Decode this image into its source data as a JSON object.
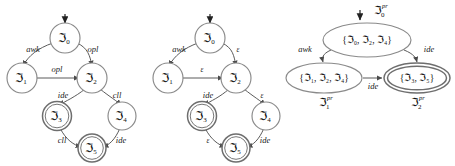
{
  "figure": {
    "name": "finite-automata-construction",
    "background_color": "#ffffff",
    "stroke_color": "#8a8a8a",
    "text_color": "#121212",
    "panels": [
      {
        "id": "nfa-left",
        "name": "nfa-with-symbol-transitions",
        "states": [
          {
            "id": "s0",
            "label": "ℑ",
            "sub": "0",
            "sup": "",
            "accepting": false,
            "start": true,
            "cx": 65,
            "cy": 38
          },
          {
            "id": "s1",
            "label": "ℑ",
            "sub": "1",
            "sup": "",
            "accepting": false,
            "start": false,
            "cx": 22,
            "cy": 78
          },
          {
            "id": "s2",
            "label": "ℑ",
            "sub": "2",
            "sup": "",
            "accepting": false,
            "start": false,
            "cx": 92,
            "cy": 78
          },
          {
            "id": "s3",
            "label": "ℑ",
            "sub": "3",
            "sup": "",
            "accepting": true,
            "start": false,
            "cx": 57,
            "cy": 116
          },
          {
            "id": "s4",
            "label": "ℑ",
            "sub": "4",
            "sup": "",
            "accepting": false,
            "start": false,
            "cx": 122,
            "cy": 116
          },
          {
            "id": "s5",
            "label": "ℑ",
            "sub": "5",
            "sup": "",
            "accepting": true,
            "start": false,
            "cx": 92,
            "cy": 148
          }
        ],
        "edges": [
          {
            "from": "s0",
            "to": "s1",
            "label": "awk",
            "lx": 33,
            "ly": 50
          },
          {
            "from": "s0",
            "to": "s2",
            "label": "opl",
            "lx": 93,
            "ly": 50
          },
          {
            "from": "s1",
            "to": "s2",
            "label": "opl",
            "lx": 57,
            "ly": 70
          },
          {
            "from": "s2",
            "to": "s3",
            "label": "ide",
            "lx": 63,
            "ly": 96
          },
          {
            "from": "s2",
            "to": "s4",
            "label": "cll",
            "lx": 117,
            "ly": 96
          },
          {
            "from": "s3",
            "to": "s5",
            "label": "cll",
            "lx": 62,
            "ly": 141
          },
          {
            "from": "s4",
            "to": "s5",
            "label": "ide",
            "lx": 121,
            "ly": 141
          }
        ]
      },
      {
        "id": "nfa-middle",
        "name": "nfa-with-epsilon-transitions",
        "states": [
          {
            "id": "s0",
            "label": "ℑ",
            "sub": "0",
            "sup": "",
            "accepting": false,
            "start": true,
            "cx": 62,
            "cy": 38
          },
          {
            "id": "s1",
            "label": "ℑ",
            "sub": "1",
            "sup": "",
            "accepting": false,
            "start": false,
            "cx": 20,
            "cy": 78
          },
          {
            "id": "s2",
            "label": "ℑ",
            "sub": "2",
            "sup": "",
            "accepting": false,
            "start": false,
            "cx": 88,
            "cy": 78
          },
          {
            "id": "s3",
            "label": "ℑ",
            "sub": "3",
            "sup": "",
            "accepting": true,
            "start": false,
            "cx": 54,
            "cy": 116
          },
          {
            "id": "s4",
            "label": "ℑ",
            "sub": "4",
            "sup": "",
            "accepting": false,
            "start": false,
            "cx": 118,
            "cy": 116
          },
          {
            "id": "s5",
            "label": "ℑ",
            "sub": "5",
            "sup": "",
            "accepting": true,
            "start": false,
            "cx": 88,
            "cy": 148
          }
        ],
        "edges": [
          {
            "from": "s0",
            "to": "s1",
            "label": "awk",
            "lx": 31,
            "ly": 50
          },
          {
            "from": "s0",
            "to": "s2",
            "label": "ε",
            "lx": 90,
            "ly": 50
          },
          {
            "from": "s1",
            "to": "s2",
            "label": "ε",
            "lx": 54,
            "ly": 70
          },
          {
            "from": "s2",
            "to": "s3",
            "label": "ide",
            "lx": 60,
            "ly": 96
          },
          {
            "from": "s2",
            "to": "s4",
            "label": "ε",
            "lx": 114,
            "ly": 96
          },
          {
            "from": "s3",
            "to": "s5",
            "label": "ε",
            "lx": 60,
            "ly": 141
          },
          {
            "from": "s4",
            "to": "s5",
            "label": "ide",
            "lx": 117,
            "ly": 141
          }
        ]
      },
      {
        "id": "dfa-right",
        "name": "deterministic-automaton-subset-construction",
        "states": [
          {
            "id": "p0",
            "set_label": "{ℑ₀, ℑ₂, ℑ₄}",
            "outer_label": "ℑ",
            "outer_sub": "0",
            "outer_sup": "pr",
            "accepting": false,
            "start": true,
            "cx": 83,
            "cy": 40,
            "rx": 44,
            "ry": 17
          },
          {
            "id": "p1",
            "set_label": "{ℑ₁, ℑ₂, ℑ₄}",
            "outer_label": "ℑ",
            "outer_sub": "1",
            "outer_sup": "pr",
            "accepting": false,
            "start": false,
            "cx": 40,
            "cy": 78,
            "rx": 38,
            "ry": 15
          },
          {
            "id": "p2",
            "set_label": "{ℑ₃, ℑ₅}",
            "outer_label": "ℑ",
            "outer_sub": "2",
            "outer_sup": "pr",
            "accepting": true,
            "start": false,
            "cx": 133,
            "cy": 78,
            "rx": 33,
            "ry": 15
          }
        ],
        "edges": [
          {
            "from": "p0",
            "to": "p1",
            "label": "awk",
            "lx": 21,
            "ly": 50
          },
          {
            "from": "p0",
            "to": "p2",
            "label": "ide",
            "lx": 142,
            "ly": 50
          },
          {
            "from": "p1",
            "to": "p2",
            "label": "ide",
            "lx": 90,
            "ly": 86
          }
        ]
      }
    ]
  }
}
